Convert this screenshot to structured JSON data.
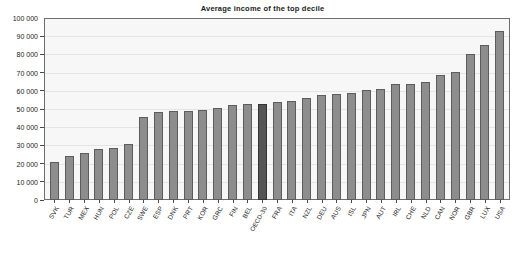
{
  "chart_data": {
    "type": "bar",
    "title": "Average income of the top decile",
    "xlabel": "",
    "ylabel": "",
    "ylim": [
      0,
      100000
    ],
    "ytick_labels": [
      "100 000",
      "90 000",
      "80 000",
      "70 000",
      "60 000",
      "50 000",
      "40 000",
      "30 000",
      "20 000",
      "10 000",
      "0"
    ],
    "ytick_values": [
      100000,
      90000,
      80000,
      70000,
      60000,
      50000,
      40000,
      30000,
      20000,
      10000,
      0
    ],
    "grid": true,
    "legend": "none",
    "highlight_category": "OECD-30",
    "colors": {
      "bar": "#8d8d8d",
      "bar_border": "#5c5c5c",
      "highlight": "#555555",
      "highlight_border": "#333333",
      "plot_background": "#f7f7f7",
      "frame": "#6e6e6e",
      "text": "#1a1a1a"
    },
    "categories": [
      "SVK",
      "TUR",
      "MEX",
      "HUN",
      "POL",
      "CZE",
      "SWE",
      "ESP",
      "DNK",
      "PRT",
      "KOR",
      "GRC",
      "FIN",
      "BEL",
      "OECD-30",
      "FRA",
      "ITA",
      "NZL",
      "DEU",
      "AUS",
      "ISL",
      "JPN",
      "AUT",
      "IRL",
      "CHE",
      "NLD",
      "CAN",
      "NOR",
      "GBR",
      "LUX",
      "USA"
    ],
    "values": [
      21000,
      24000,
      26000,
      28000,
      28500,
      31000,
      45500,
      48500,
      48800,
      49000,
      49200,
      50500,
      52000,
      53000,
      53000,
      54000,
      54500,
      56000,
      57500,
      58500,
      59000,
      60500,
      61000,
      63500,
      64000,
      65000,
      68500,
      70500,
      80000,
      85000,
      93000
    ]
  }
}
